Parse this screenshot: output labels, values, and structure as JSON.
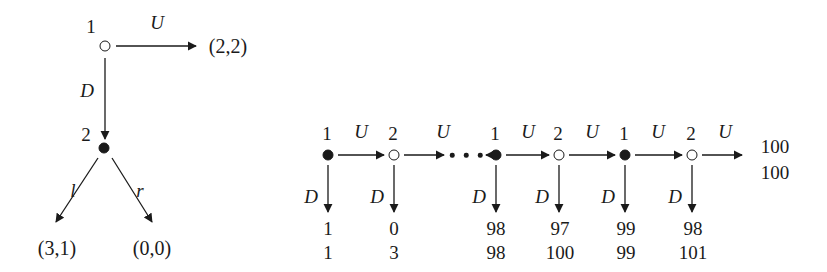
{
  "figure": {
    "background_color": "#ffffff",
    "ink_color": "#1a1a1a"
  },
  "left_tree": {
    "name": "simple-two-stage-game",
    "root": {
      "player_label": "1",
      "node_type": "open",
      "x": 105,
      "y": 46
    },
    "second": {
      "player_label": "2",
      "node_type": "filled",
      "x": 104,
      "y": 148
    },
    "edges": [
      {
        "action": "U",
        "label_x": 157,
        "label_y": 22,
        "from_x": 116,
        "from_y": 46,
        "to_x": 196,
        "to_y": 46
      },
      {
        "action": "D",
        "label_x": 87,
        "label_y": 90,
        "from_x": 105,
        "from_y": 58,
        "to_x": 105,
        "to_y": 139
      },
      {
        "action": "l",
        "label_x": 73,
        "label_y": 190,
        "from_x": 98,
        "from_y": 158,
        "to_x": 56,
        "to_y": 222
      },
      {
        "action": "r",
        "label_x": 140,
        "label_y": 190,
        "from_x": 112,
        "from_y": 158,
        "to_x": 152,
        "to_y": 222
      }
    ],
    "payoffs": [
      {
        "text": "(2,2)",
        "x": 228,
        "y": 46
      },
      {
        "text": "(3,1)",
        "x": 57,
        "y": 248
      },
      {
        "text": "(0,0)",
        "x": 152,
        "y": 248
      }
    ]
  },
  "right_tree": {
    "name": "centipede-game",
    "nodes": [
      {
        "player_label": "1",
        "node_type": "filled",
        "x": 328,
        "y": 155
      },
      {
        "player_label": "2",
        "node_type": "open",
        "x": 394,
        "y": 155
      },
      {
        "player_label": "1",
        "node_type": "filled",
        "x": 496,
        "y": 155
      },
      {
        "player_label": "2",
        "node_type": "open",
        "x": 559,
        "y": 155
      },
      {
        "player_label": "1",
        "node_type": "filled",
        "x": 625,
        "y": 155
      },
      {
        "player_label": "2",
        "node_type": "open",
        "x": 692,
        "y": 155
      }
    ],
    "across_action": "U",
    "down_action": "D",
    "across_labels": [
      {
        "text": "U",
        "x": 361,
        "y": 131
      },
      {
        "text": "U",
        "x": 443,
        "y": 131
      },
      {
        "text": "U",
        "x": 528,
        "y": 131
      },
      {
        "text": "U",
        "x": 592,
        "y": 131
      },
      {
        "text": "U",
        "x": 658,
        "y": 131
      },
      {
        "text": "U",
        "x": 725,
        "y": 131
      }
    ],
    "down_labels": [
      {
        "text": "D",
        "x": 311,
        "y": 196
      },
      {
        "text": "D",
        "x": 377,
        "y": 196
      },
      {
        "text": "D",
        "x": 479,
        "y": 196
      },
      {
        "text": "D",
        "x": 542,
        "y": 196
      },
      {
        "text": "D",
        "x": 608,
        "y": 196
      },
      {
        "text": "D",
        "x": 675,
        "y": 196
      }
    ],
    "ellipsis_dots": [
      {
        "x": 452,
        "y": 155
      },
      {
        "x": 466,
        "y": 155
      },
      {
        "x": 480,
        "y": 155
      }
    ],
    "down_payoffs": [
      {
        "top": "1",
        "bottom": "1",
        "x": 328,
        "top_y": 228,
        "bottom_y": 252
      },
      {
        "top": "0",
        "bottom": "3",
        "x": 394,
        "top_y": 228,
        "bottom_y": 252
      },
      {
        "top": "98",
        "bottom": "98",
        "x": 496,
        "top_y": 228,
        "bottom_y": 252
      },
      {
        "top": "97",
        "bottom": "100",
        "x": 560,
        "top_y": 228,
        "bottom_y": 252
      },
      {
        "top": "99",
        "bottom": "99",
        "x": 626,
        "top_y": 228,
        "bottom_y": 252
      },
      {
        "top": "98",
        "bottom": "101",
        "x": 693,
        "top_y": 228,
        "bottom_y": 252
      }
    ],
    "terminal_payoff": {
      "top": "100",
      "bottom": "100",
      "x": 775,
      "top_y": 146,
      "bottom_y": 172
    }
  }
}
